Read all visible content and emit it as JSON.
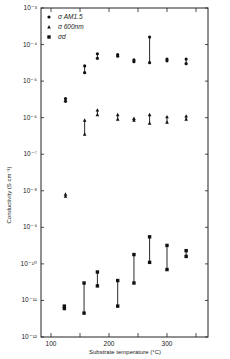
{
  "chart_data": {
    "type": "scatter",
    "title": "",
    "xlabel": "Substrate temperature (°C)",
    "ylabel": "Conductivity (S cm⁻¹)",
    "xlim": [
      80,
      370
    ],
    "ylim": [
      1e-12,
      0.001
    ],
    "yscale": "log",
    "grid": false,
    "legend_position": "upper-left",
    "x_ticks": [
      100,
      150,
      200,
      250,
      300,
      350
    ],
    "x_tick_labels": [
      "100",
      "",
      "200",
      "",
      "300",
      ""
    ],
    "y_ticks": [
      0.001,
      0.0001,
      1e-05,
      1e-06,
      1e-07,
      1e-08,
      1e-09,
      1e-10,
      1e-11,
      1e-12
    ],
    "y_tick_labels": [
      "10⁻³",
      "10⁻⁴",
      "10⁻⁵",
      "10⁻⁶",
      "10⁻⁷",
      "10⁻⁸",
      "10⁻⁹",
      "10⁻¹⁰",
      "10⁻¹¹",
      "10⁻¹²"
    ],
    "legend": [
      {
        "marker": "circle",
        "label": "σ AM1.5"
      },
      {
        "marker": "triangle",
        "label": "σ 600nm"
      },
      {
        "marker": "square",
        "label": "σd"
      }
    ],
    "series": [
      {
        "name": "σ AM1.5",
        "marker": "circle",
        "points": [
          {
            "x": 125,
            "y_low": 2.8e-06,
            "y_high": 3.3e-06
          },
          {
            "x": 158,
            "y_low": 1.7e-05,
            "y_high": 2.6e-05
          },
          {
            "x": 180,
            "y_low": 4.2e-05,
            "y_high": 5.6e-05
          },
          {
            "x": 215,
            "y_low": 4.8e-05,
            "y_high": 5.3e-05
          },
          {
            "x": 243,
            "y_low": 3.4e-05,
            "y_high": 3.8e-05
          },
          {
            "x": 270,
            "y_low": 3.2e-05,
            "y_high": 0.00016
          },
          {
            "x": 300,
            "y_low": 3.6e-05,
            "y_high": 4e-05
          },
          {
            "x": 333,
            "y_low": 3e-05,
            "y_high": 4e-05
          }
        ]
      },
      {
        "name": "σ 600nm",
        "marker": "triangle",
        "points": [
          {
            "x": 125,
            "y_low": 7e-09,
            "y_high": 8e-09
          },
          {
            "x": 158,
            "y_low": 3.5e-07,
            "y_high": 8.5e-07
          },
          {
            "x": 180,
            "y_low": 1.2e-06,
            "y_high": 1.6e-06
          },
          {
            "x": 215,
            "y_low": 9e-07,
            "y_high": 1.2e-06
          },
          {
            "x": 243,
            "y_low": 8.5e-07,
            "y_high": 9.5e-07
          },
          {
            "x": 270,
            "y_low": 7e-07,
            "y_high": 1.2e-06
          },
          {
            "x": 300,
            "y_low": 7.5e-07,
            "y_high": 1.05e-06
          },
          {
            "x": 333,
            "y_low": 9e-07,
            "y_high": 1.1e-06
          }
        ]
      },
      {
        "name": "σd",
        "marker": "square",
        "points": [
          {
            "x": 123,
            "y_low": 6e-12,
            "y_high": 7e-12
          },
          {
            "x": 157,
            "y_low": 4.5e-12,
            "y_high": 3e-11
          },
          {
            "x": 180,
            "y_low": 2.5e-11,
            "y_high": 6e-11
          },
          {
            "x": 215,
            "y_low": 7e-12,
            "y_high": 3.5e-11
          },
          {
            "x": 243,
            "y_low": 3e-11,
            "y_high": 1.8e-10
          },
          {
            "x": 270,
            "y_low": 1.1e-10,
            "y_high": 5.5e-10
          },
          {
            "x": 300,
            "y_low": 7e-11,
            "y_high": 3.2e-10
          },
          {
            "x": 333,
            "y_low": 1.6e-10,
            "y_high": 2.3e-10
          }
        ]
      }
    ]
  },
  "layout": {
    "plot_left": 41,
    "plot_right": 208,
    "plot_top": 8,
    "plot_bottom": 337
  }
}
